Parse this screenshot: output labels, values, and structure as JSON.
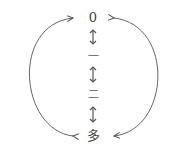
{
  "diagram": {
    "nodes": [
      {
        "id": "zero",
        "label": "0"
      },
      {
        "id": "one",
        "label": "一"
      },
      {
        "id": "two",
        "label": "二"
      },
      {
        "id": "many",
        "label": "多"
      }
    ],
    "edges": [
      {
        "from": "zero",
        "to": "one",
        "type": "bidirectional"
      },
      {
        "from": "one",
        "to": "two",
        "type": "bidirectional"
      },
      {
        "from": "two",
        "to": "many",
        "type": "bidirectional"
      },
      {
        "from": "many",
        "to": "zero",
        "type": "left-arc-bidirectional"
      },
      {
        "from": "zero",
        "to": "many",
        "type": "right-arc-bidirectional"
      }
    ],
    "stroke_color": "#555555"
  }
}
